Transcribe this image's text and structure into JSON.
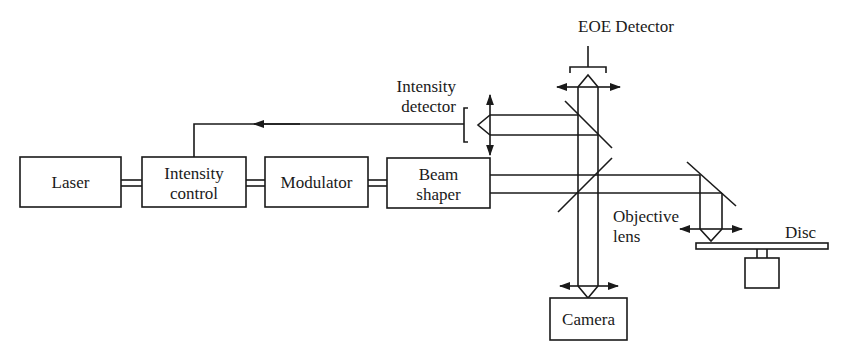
{
  "diagram": {
    "type": "optical-setup-block-diagram",
    "blocks": {
      "laser": "Laser",
      "intensity_control_line1": "Intensity",
      "intensity_control_line2": "control",
      "modulator": "Modulator",
      "beam_shaper_line1": "Beam",
      "beam_shaper_line2": "shaper",
      "camera": "Camera"
    },
    "labels": {
      "eoe_detector": "EOE Detector",
      "intensity_detector_line1": "Intensity",
      "intensity_detector_line2": "detector",
      "objective_line1": "Objective",
      "objective_line2": "lens",
      "disc": "Disc"
    },
    "connections": [
      {
        "from": "Laser",
        "to": "Intensity control",
        "style": "double-line"
      },
      {
        "from": "Intensity control",
        "to": "Modulator",
        "style": "double-line"
      },
      {
        "from": "Modulator",
        "to": "Beam shaper",
        "style": "double-line"
      },
      {
        "from": "Intensity detector",
        "to": "Intensity control",
        "style": "feedback-arrow"
      },
      {
        "from": "Beam shaper",
        "to": "Objective lens",
        "style": "beam"
      },
      {
        "from": "Beam splitter",
        "to": "Camera",
        "style": "beam"
      },
      {
        "from": "Beam splitter",
        "to": "EOE Detector",
        "style": "beam"
      }
    ]
  }
}
